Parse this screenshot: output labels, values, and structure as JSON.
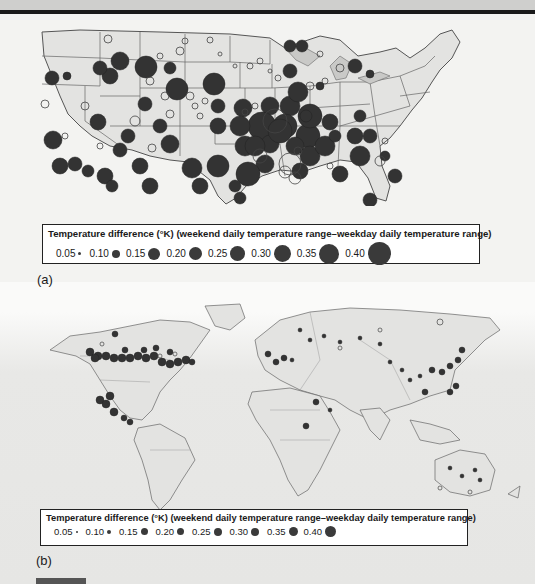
{
  "panel_a": {
    "label": "(a)",
    "region": "Contiguous United States",
    "legend": {
      "title": "Temperature difference (°K) (weekend daily temperature range–weekday daily temperature range)",
      "items": [
        {
          "label": "0.05",
          "size": 3
        },
        {
          "label": "0.10",
          "size": 8
        },
        {
          "label": "0.15",
          "size": 12
        },
        {
          "label": "0.20",
          "size": 13
        },
        {
          "label": "0.25",
          "size": 15
        },
        {
          "label": "0.30",
          "size": 17
        },
        {
          "label": "0.35",
          "size": 20
        },
        {
          "label": "0.40",
          "size": 23
        }
      ]
    }
  },
  "panel_b": {
    "label": "(b)",
    "region": "World",
    "legend": {
      "title": "Temperature difference (°K) (weekend daily temperature range–weekday daily temperature range)",
      "items": [
        {
          "label": "0.05",
          "size": 2
        },
        {
          "label": "0.10",
          "size": 4
        },
        {
          "label": "0.15",
          "size": 7
        },
        {
          "label": "0.20",
          "size": 7
        },
        {
          "label": "0.25",
          "size": 8
        },
        {
          "label": "0.30",
          "size": 8
        },
        {
          "label": "0.35",
          "size": 9
        },
        {
          "label": "0.40",
          "size": 11
        }
      ]
    }
  },
  "colors": {
    "land": "#e3e3e1",
    "border": "#555555",
    "positive_dot": "#2f2f2f",
    "negative_dot_stroke": "#444444",
    "background": "#f3f3f1"
  }
}
